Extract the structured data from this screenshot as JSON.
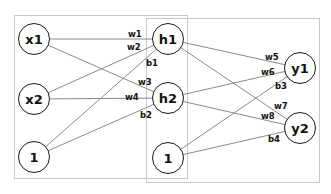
{
  "diagram": {
    "type": "neural-network",
    "colors": {
      "edge": "#8a8a8a",
      "node_border": "#1a1a1a",
      "box_border": "#c8c8c8",
      "text": "#111111"
    },
    "boxes": [
      {
        "id": "input-hidden-box",
        "x": 14,
        "y": 15,
        "w": 174,
        "h": 164
      },
      {
        "id": "hidden-output-box",
        "x": 146,
        "y": 18,
        "w": 174,
        "h": 165
      }
    ],
    "nodes": [
      {
        "id": "x1",
        "label": "x1",
        "cx": 34,
        "cy": 39
      },
      {
        "id": "x2",
        "label": "x2",
        "cx": 34,
        "cy": 99
      },
      {
        "id": "bias1",
        "label": "1",
        "cx": 34,
        "cy": 157
      },
      {
        "id": "h1",
        "label": "h1",
        "cx": 168,
        "cy": 39
      },
      {
        "id": "h2",
        "label": "h2",
        "cx": 168,
        "cy": 98
      },
      {
        "id": "bias2",
        "label": "1",
        "cx": 168,
        "cy": 158
      },
      {
        "id": "y1",
        "label": "y1",
        "cx": 300,
        "cy": 68
      },
      {
        "id": "y2",
        "label": "y2",
        "cx": 300,
        "cy": 128
      }
    ],
    "edges": [
      {
        "from": "x1",
        "to": "h1",
        "label": "w1",
        "lx": 128,
        "ly": 30
      },
      {
        "from": "x2",
        "to": "h1",
        "label": "w2",
        "lx": 127,
        "ly": 43
      },
      {
        "from": "bias1",
        "to": "h1",
        "label": "b1",
        "lx": 146,
        "ly": 59
      },
      {
        "from": "x1",
        "to": "h2",
        "label": "w3",
        "lx": 138,
        "ly": 78
      },
      {
        "from": "x2",
        "to": "h2",
        "label": "w4",
        "lx": 125,
        "ly": 93
      },
      {
        "from": "bias1",
        "to": "h2",
        "label": "b2",
        "lx": 140,
        "ly": 111
      },
      {
        "from": "h1",
        "to": "y1",
        "label": "w5",
        "lx": 265,
        "ly": 53
      },
      {
        "from": "h2",
        "to": "y1",
        "label": "w6",
        "lx": 261,
        "ly": 68
      },
      {
        "from": "bias2",
        "to": "y1",
        "label": "b3",
        "lx": 275,
        "ly": 82
      },
      {
        "from": "h1",
        "to": "y2",
        "label": "w7",
        "lx": 274,
        "ly": 102
      },
      {
        "from": "h2",
        "to": "y2",
        "label": "w8",
        "lx": 261,
        "ly": 112
      },
      {
        "from": "bias2",
        "to": "y2",
        "label": "b4",
        "lx": 268,
        "ly": 135
      }
    ]
  }
}
